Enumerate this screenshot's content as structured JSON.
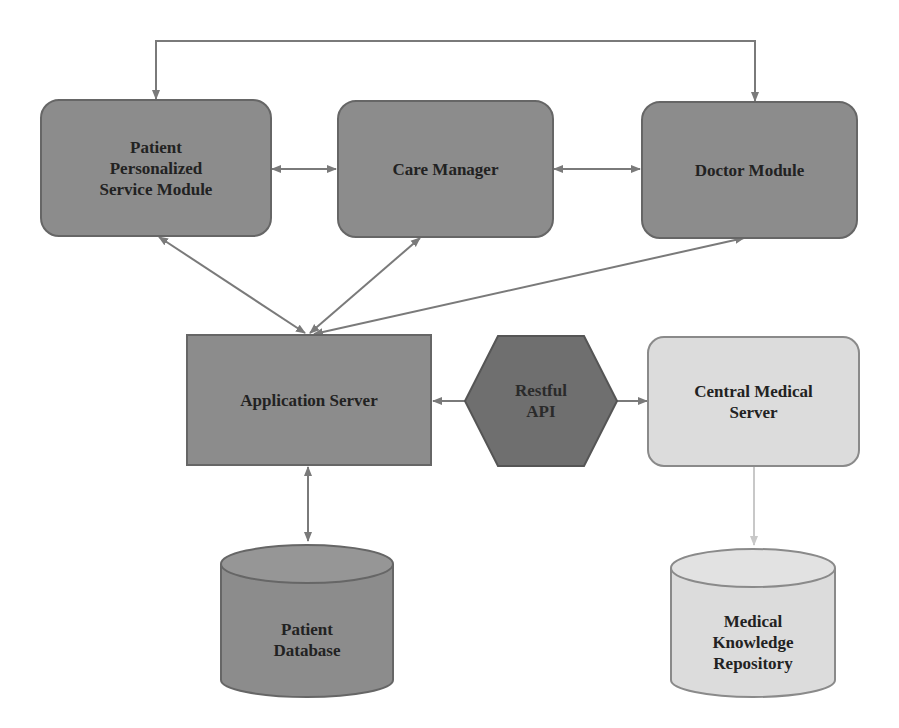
{
  "diagram": {
    "colors": {
      "dark_fill": "#8c8c8c",
      "darker_fill": "#6f6f6f",
      "light_fill": "#dcdcdc",
      "border": "#666666",
      "light_border": "#8a8a8a",
      "arrow": "#7a7a7a",
      "light_arrow": "#c8c8c8",
      "text": "#222222"
    },
    "nodes": {
      "patient_module": {
        "label": "Patient\nPersonalized\nService Module",
        "shape": "rounded-rect"
      },
      "care_manager": {
        "label": "Care Manager",
        "shape": "rounded-rect"
      },
      "doctor_module": {
        "label": "Doctor Module",
        "shape": "rounded-rect"
      },
      "application_server": {
        "label": "Application Server",
        "shape": "rect"
      },
      "restful_api": {
        "label": "Restful\nAPI",
        "shape": "hexagon"
      },
      "central_medical_server": {
        "label": "Central Medical\nServer",
        "shape": "rounded-rect"
      },
      "patient_database": {
        "label": "Patient\nDatabase",
        "shape": "cylinder"
      },
      "medical_knowledge_repository": {
        "label": "Medical\nKnowledge\nRepository",
        "shape": "cylinder"
      }
    },
    "edges": [
      {
        "from": "patient_module",
        "to": "doctor_module",
        "type": "bidirectional",
        "route": "over-top"
      },
      {
        "from": "patient_module",
        "to": "care_manager",
        "type": "bidirectional"
      },
      {
        "from": "care_manager",
        "to": "doctor_module",
        "type": "bidirectional"
      },
      {
        "from": "patient_module",
        "to": "application_server",
        "type": "bidirectional"
      },
      {
        "from": "care_manager",
        "to": "application_server",
        "type": "bidirectional"
      },
      {
        "from": "doctor_module",
        "to": "application_server",
        "type": "bidirectional"
      },
      {
        "from": "restful_api",
        "to": "application_server",
        "type": "directed"
      },
      {
        "from": "restful_api",
        "to": "central_medical_server",
        "type": "directed"
      },
      {
        "from": "application_server",
        "to": "patient_database",
        "type": "bidirectional"
      },
      {
        "from": "central_medical_server",
        "to": "medical_knowledge_repository",
        "type": "directed"
      }
    ]
  }
}
